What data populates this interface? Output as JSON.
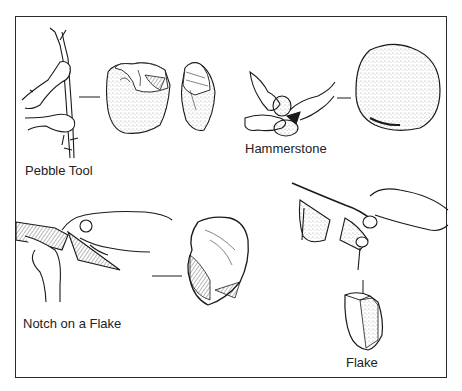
{
  "figure": {
    "labels": {
      "pebble_tool": "Pebble Tool",
      "hammerstone": "Hammerstone",
      "notch_on_flake": "Notch on a Flake",
      "flake": "Flake"
    },
    "caption_visible": "",
    "colors": {
      "ink": "#1a1a1a",
      "frame": "#2a2a2a",
      "background": "#ffffff"
    }
  }
}
